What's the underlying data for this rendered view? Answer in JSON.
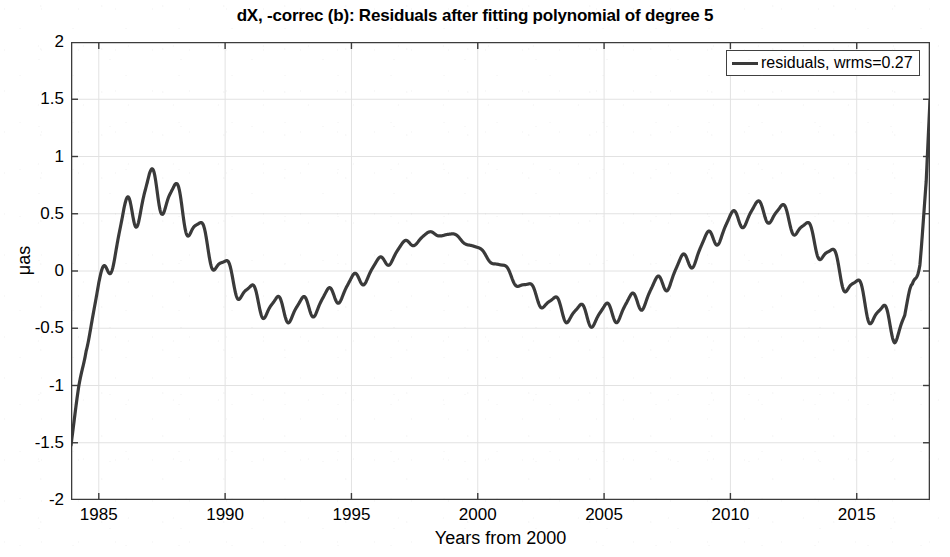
{
  "chart_data": {
    "type": "line",
    "title": "dX, -correc (b): Residuals after fitting polynomial of degree 5",
    "xlabel": "Years from 2000",
    "ylabel": "μas",
    "xlim": [
      1983.9,
      2017.9
    ],
    "ylim": [
      -2,
      2
    ],
    "xticks": [
      1985,
      1990,
      1995,
      2000,
      2005,
      2010,
      2015
    ],
    "xticklabels": [
      "1985",
      "1990",
      "1995",
      "2000",
      "2005",
      "2010",
      "2015"
    ],
    "yticks": [
      -2,
      -1.5,
      -1,
      -0.5,
      0,
      0.5,
      1,
      1.5,
      2
    ],
    "yticklabels": [
      "-2",
      "-1.5",
      "-1",
      "-0.5",
      "0",
      "0.5",
      "1",
      "1.5",
      "2"
    ],
    "grid": true,
    "legend_position": "top-right",
    "line_color": "#3a3a3a",
    "line_width": 3.2,
    "series": [
      {
        "name": "residuals, wrms=0.27",
        "wrms": 0.27,
        "comment": "Trend (smooth low-frequency component) sampled yearly; an annual oscillation of the given amplitude is superimposed.",
        "x": [
          1983.9,
          1984.2,
          1984.5,
          1985.0,
          1985.5,
          1986.0,
          1986.5,
          1987.0,
          1987.5,
          1988.0,
          1988.5,
          1989.0,
          1989.5,
          1990.0,
          1990.5,
          1991.0,
          1991.5,
          1992.0,
          1992.5,
          1993.0,
          1993.5,
          1994.0,
          1994.5,
          1995.0,
          1995.5,
          1996.0,
          1996.5,
          1997.0,
          1997.5,
          1998.0,
          1998.5,
          1999.0,
          1999.5,
          2000.0,
          2000.5,
          2001.0,
          2001.5,
          2002.0,
          2002.5,
          2003.0,
          2003.5,
          2004.0,
          2004.5,
          2005.0,
          2005.5,
          2006.0,
          2006.5,
          2007.0,
          2007.5,
          2008.0,
          2008.5,
          2009.0,
          2009.5,
          2010.0,
          2010.5,
          2011.0,
          2011.5,
          2012.0,
          2012.5,
          2013.0,
          2013.5,
          2014.0,
          2014.5,
          2015.0,
          2015.5,
          2016.0,
          2016.5,
          2016.9,
          2017.2,
          2017.5,
          2017.75,
          2017.9
        ],
        "trend": [
          -1.53,
          -1.05,
          -0.62,
          -0.18,
          0.15,
          0.42,
          0.6,
          0.7,
          0.7,
          0.62,
          0.48,
          0.32,
          0.15,
          0.0,
          -0.12,
          -0.22,
          -0.29,
          -0.33,
          -0.34,
          -0.33,
          -0.3,
          -0.25,
          -0.19,
          -0.12,
          -0.04,
          0.04,
          0.12,
          0.2,
          0.27,
          0.31,
          0.33,
          0.31,
          0.26,
          0.19,
          0.11,
          0.02,
          -0.07,
          -0.16,
          -0.24,
          -0.3,
          -0.35,
          -0.38,
          -0.39,
          -0.38,
          -0.35,
          -0.3,
          -0.24,
          -0.16,
          -0.07,
          0.03,
          0.13,
          0.23,
          0.33,
          0.42,
          0.48,
          0.52,
          0.52,
          0.49,
          0.43,
          0.34,
          0.23,
          0.1,
          -0.04,
          -0.18,
          -0.31,
          -0.42,
          -0.48,
          -0.44,
          -0.22,
          0.2,
          0.8,
          1.45
        ],
        "annual_amplitude": [
          0.02,
          0.04,
          0.07,
          0.1,
          0.14,
          0.17,
          0.19,
          0.19,
          0.18,
          0.17,
          0.15,
          0.13,
          0.12,
          0.11,
          0.11,
          0.11,
          0.11,
          0.11,
          0.1,
          0.1,
          0.09,
          0.09,
          0.08,
          0.08,
          0.07,
          0.06,
          0.06,
          0.05,
          0.04,
          0.03,
          0.02,
          0.02,
          0.02,
          0.02,
          0.03,
          0.04,
          0.05,
          0.06,
          0.07,
          0.08,
          0.09,
          0.09,
          0.09,
          0.09,
          0.09,
          0.09,
          0.09,
          0.09,
          0.09,
          0.09,
          0.09,
          0.09,
          0.09,
          0.09,
          0.09,
          0.09,
          0.09,
          0.1,
          0.1,
          0.1,
          0.11,
          0.11,
          0.12,
          0.12,
          0.13,
          0.13,
          0.13,
          0.13,
          0.13,
          0.13,
          0.12,
          0.1
        ],
        "notable_points": {
          "start_value": -1.53,
          "first_peak": {
            "x": 1987.0,
            "y": 0.9
          },
          "first_trough": {
            "x": 1992.3,
            "y": -0.45
          },
          "mid_peak": {
            "x": 1998.3,
            "y": 0.34
          },
          "mid_trough": {
            "x": 2004.2,
            "y": -0.46
          },
          "second_peak": {
            "x": 2010.8,
            "y": 0.65
          },
          "last_trough": {
            "x": 2016.4,
            "y": -0.65
          },
          "end_value": 1.7
        }
      }
    ]
  },
  "legend": {
    "entries": [
      {
        "label": "residuals, wrms=0.27",
        "color": "#3a3a3a"
      }
    ]
  },
  "figure": {
    "background": "#ffffff",
    "grid_color": "#e2e2e2",
    "axis_color": "#3c3c3c"
  }
}
